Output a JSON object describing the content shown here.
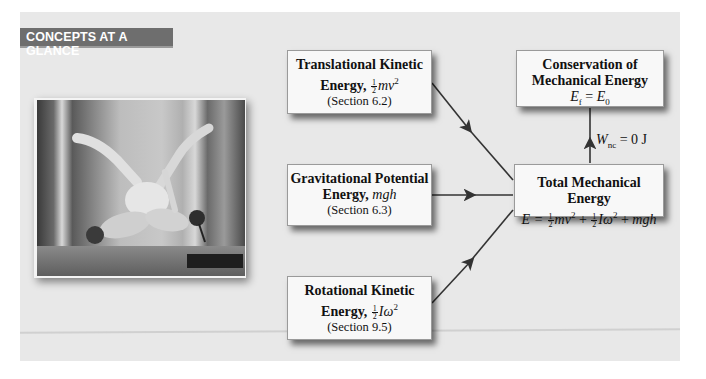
{
  "banner": {
    "label": "CONCEPTS AT A GLANCE"
  },
  "photo": {
    "alt": "Two synchronized divers mid-air in a tuck position"
  },
  "boxes": {
    "translational": {
      "title_line1": "Translational Kinetic",
      "title_line2": "Energy,",
      "formula_num": "1",
      "formula_den": "2",
      "formula_rest": "mv",
      "formula_exp": "2",
      "section": "(Section 6.2)"
    },
    "gravitational": {
      "title_line1": "Gravitational Potential",
      "title_line2": "Energy,",
      "formula": "mgh",
      "section": "(Section 6.3)"
    },
    "rotational": {
      "title_line1": "Rotational Kinetic",
      "title_line2": "Energy,",
      "formula_num": "1",
      "formula_den": "2",
      "formula_rest": "Iω",
      "formula_exp": "2",
      "section": "(Section 9.5)"
    },
    "total": {
      "title": "Total Mechanical Energy",
      "lhs": "E =",
      "t1_num": "1",
      "t1_den": "2",
      "t1": "mv",
      "t1_exp": "2",
      "plus1": "+",
      "t2_num": "1",
      "t2_den": "2",
      "t2": "Iω",
      "t2_exp": "2",
      "plus2": "+",
      "t3": "mgh"
    },
    "conservation": {
      "title_line1": "Conservation of",
      "title_line2": "Mechanical Energy",
      "ef": "E",
      "ef_sub": "f",
      "eq": "=",
      "e0": "E",
      "e0_sub": "0"
    }
  },
  "arrow_label": {
    "w": "W",
    "sub": "nc",
    "rest": "= 0 J"
  },
  "colors": {
    "panel": "#e8e8e8",
    "banner": "#6e6e6e",
    "box": "#f8f8f8",
    "text": "#111111"
  }
}
